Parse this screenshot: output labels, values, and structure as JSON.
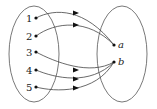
{
  "diagram": {
    "type": "function-mapping",
    "domain_set": {
      "elements": [
        "1",
        "2",
        "3",
        "4",
        "5"
      ]
    },
    "codomain_set": {
      "elements": [
        "a",
        "b"
      ]
    },
    "mapping": [
      {
        "from": "1",
        "to": "a"
      },
      {
        "from": "2",
        "to": "a"
      },
      {
        "from": "3",
        "to": "b"
      },
      {
        "from": "4",
        "to": "b"
      },
      {
        "from": "5",
        "to": "b"
      }
    ],
    "colors": {
      "stroke": "#444444",
      "point": "#111111",
      "background": "#ffffff"
    }
  }
}
